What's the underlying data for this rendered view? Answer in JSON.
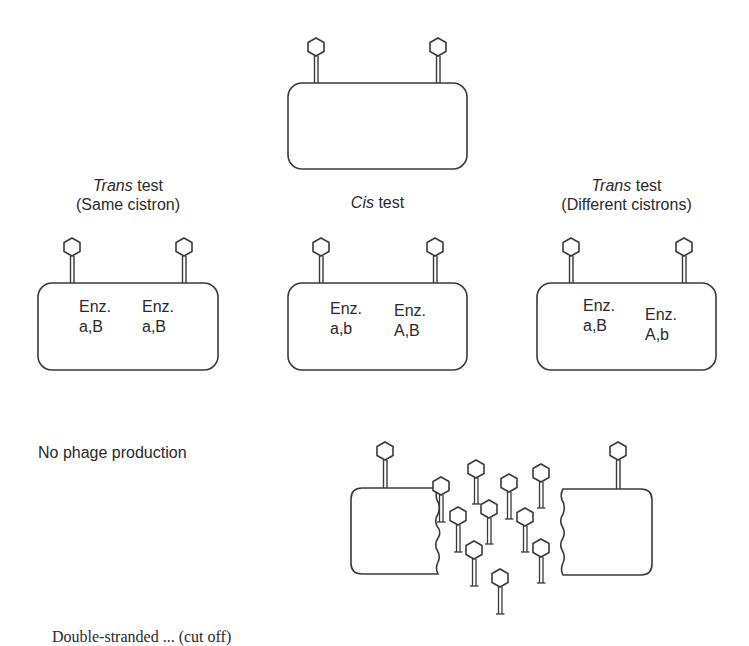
{
  "diagram": {
    "type": "cis-trans complementation test",
    "top_cell": {
      "phages": 2
    },
    "panels": [
      {
        "id": "trans-same",
        "title_italic": "Trans",
        "title_rest": " test",
        "subtitle": "(Same cistron)",
        "enzymes": [
          {
            "label": "Enz.",
            "genotype": "a,B"
          },
          {
            "label": "Enz.",
            "genotype": "a,B"
          }
        ]
      },
      {
        "id": "cis",
        "title_italic": "Cis",
        "title_rest": " test",
        "subtitle": "",
        "enzymes": [
          {
            "label": "Enz.",
            "genotype": "a,b"
          },
          {
            "label": "Enz.",
            "genotype": "A,B"
          }
        ]
      },
      {
        "id": "trans-different",
        "title_italic": "Trans",
        "title_rest": " test",
        "subtitle": "(Different cistrons)",
        "enzymes": [
          {
            "label": "Enz.",
            "genotype": "a,B"
          },
          {
            "label": "Enz.",
            "genotype": "A,b"
          }
        ]
      }
    ],
    "outcome_left": "No phage production",
    "outcome_right": {
      "lysed_cell": true,
      "released_phages": 10
    },
    "colors": {
      "stroke": "#3a3a3a",
      "background": "#ffffff",
      "text": "#2a2a2a"
    }
  },
  "caption_cropped": "Double-stranded ... (cut off)"
}
